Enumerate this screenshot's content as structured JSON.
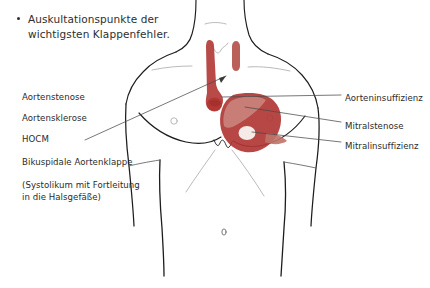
{
  "slide": {
    "width": 430,
    "height": 288,
    "background": "#ffffff",
    "title_bullet": {
      "line1": "Auskultationspunkte der",
      "line2": "wichtigsten Klappenfehler.",
      "bullet_glyph": "•"
    }
  },
  "colors": {
    "text": "#2b2b2b",
    "outline": "#1d1d1d",
    "outline_faint": "#9a9a9a",
    "marker_red": "#b03734",
    "marker_red_light": "#c4746a",
    "marker_red_pale": "#d99a90",
    "marker_highlight": "#f2e4e2",
    "leader_line": "#4a4a4a"
  },
  "left_labels": [
    {
      "id": "aortenstenose",
      "text": "Aortenstenose",
      "x": 22,
      "y": 92
    },
    {
      "id": "aortensklerose",
      "text": "Aortensklerose",
      "x": 22,
      "y": 113
    },
    {
      "id": "hocm",
      "text": "HOCM",
      "x": 22,
      "y": 134
    },
    {
      "id": "bikuspidale-aortenklappe",
      "text": "Bikuspidale Aortenklappe",
      "x": 22,
      "y": 157
    }
  ],
  "left_note": {
    "id": "systolikum-note",
    "line1": "(Systolikum mit Fortleitung",
    "line2": "in die Halsgefäße)",
    "x": 22,
    "y": 178
  },
  "right_labels": [
    {
      "id": "aorteninsuffizienz",
      "text": "Aorteninsuffizienz",
      "x": 345,
      "y": 93
    },
    {
      "id": "mitralstenose",
      "text": "Mitralstenose",
      "x": 345,
      "y": 121
    },
    {
      "id": "mitralinsuffizienz",
      "text": "Mitralinsuffizienz",
      "x": 345,
      "y": 141
    }
  ],
  "leader_lines": [
    {
      "id": "leader-left-aortic",
      "from": [
        85,
        140
      ],
      "to": [
        226,
        76
      ],
      "note": "from left label group to upper aortic marker"
    },
    {
      "id": "leader-aorteninsuffizienz",
      "from": [
        341,
        95
      ],
      "to": [
        222,
        97
      ],
      "note": "to sternal / aortic area"
    },
    {
      "id": "leader-mitralstenose",
      "from": [
        341,
        122
      ],
      "to": [
        245,
        107
      ],
      "note": "to upper heart marker band"
    },
    {
      "id": "leader-mitralinsuffizienz",
      "from": [
        341,
        142
      ],
      "to": [
        252,
        132
      ],
      "note": "to apex highlight"
    }
  ],
  "markers": [
    {
      "id": "aortic-strip-long",
      "label": "long red strip, left neck, bulb at base",
      "color": "#b03734"
    },
    {
      "id": "aortic-strip-short",
      "label": "short red strip, right neck",
      "color": "#b4524b"
    },
    {
      "id": "heart-crescent",
      "label": "red crescent over left chest (heart)",
      "color": "#b03734"
    },
    {
      "id": "heart-band",
      "label": "lighter diagonal band across crescent",
      "color": "#c4746a"
    },
    {
      "id": "apex-highlight",
      "label": "pale ellipse at cardiac apex",
      "color": "#f2e4e2"
    }
  ],
  "anatomy_parts": [
    "neck-left-contour",
    "neck-right-contour",
    "clavicle-left",
    "clavicle-right",
    "shoulder-left",
    "shoulder-right",
    "arm-left",
    "arm-right",
    "chest-outline",
    "breast-fold-left",
    "breast-fold-right",
    "nipple-left",
    "nipple-right",
    "sternum-notch",
    "ribcage-left",
    "ribcage-right",
    "navel",
    "waist-left",
    "waist-right",
    "suprasternal-notch"
  ]
}
